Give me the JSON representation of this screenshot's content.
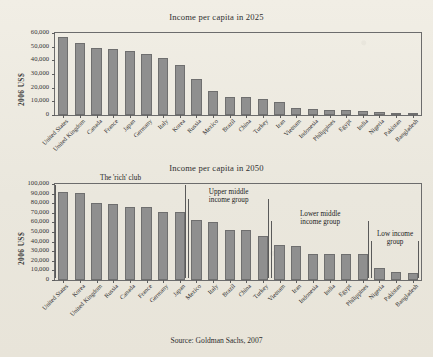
{
  "source_note": "Source: Goldman Sachs, 2007",
  "axis": {
    "ylabel": "2006 US$"
  },
  "chart_data": [
    {
      "type": "bar",
      "title": "Income per capita in 2025",
      "xlabel": "",
      "ylabel": "2006 US$",
      "ylim": [
        0,
        60000
      ],
      "yticks": [
        0,
        10000,
        20000,
        30000,
        40000,
        50000,
        60000
      ],
      "ytick_labels": [
        "0",
        "10,000",
        "20,000",
        "30,000",
        "40,000",
        "50,000",
        "60,000"
      ],
      "grid": false,
      "legend": "none",
      "categories": [
        "United States",
        "United Kingdom",
        "Canada",
        "France",
        "Japan",
        "Germany",
        "Italy",
        "Korea",
        "Russia",
        "Mexico",
        "Brazil",
        "China",
        "Turkey",
        "Iran",
        "Vietnam",
        "Indonesia",
        "Philippines",
        "Egypt",
        "India",
        "Nigeria",
        "Pakistan",
        "Bangladesh"
      ],
      "values": [
        57000,
        52500,
        49000,
        48500,
        46500,
        45000,
        41500,
        36800,
        26200,
        17700,
        13400,
        13000,
        12000,
        9700,
        5200,
        4300,
        3800,
        3700,
        2800,
        2100,
        1400,
        1200
      ]
    },
    {
      "type": "bar",
      "title": "Income per capita in 2050",
      "xlabel": "",
      "ylabel": "2006 US$",
      "ylim": [
        0,
        100000
      ],
      "yticks": [
        0,
        10000,
        20000,
        30000,
        40000,
        50000,
        60000,
        70000,
        80000,
        90000,
        100000
      ],
      "ytick_labels": [
        "0",
        "10,000",
        "20,000",
        "30,000",
        "40,000",
        "50,000",
        "60,000",
        "70,000",
        "80,000",
        "90,000",
        "100,000"
      ],
      "grid": false,
      "legend": "none",
      "categories": [
        "United States",
        "Korea",
        "United Kingdom",
        "Russia",
        "Canada",
        "France",
        "Germany",
        "Japan",
        "Mexico",
        "Italy",
        "Brazil",
        "China",
        "Turkey",
        "Vietnam",
        "Iran",
        "Indonesia",
        "India",
        "Egypt",
        "Philippines",
        "Nigeria",
        "Pakistan",
        "Bangladesh"
      ],
      "values": [
        91500,
        91000,
        80000,
        79500,
        76000,
        76000,
        71000,
        70500,
        63000,
        60500,
        52500,
        52000,
        45500,
        36500,
        35500,
        27000,
        27000,
        27000,
        27500,
        12500,
        8000,
        7500
      ],
      "annotations": [
        {
          "label": "The 'rich' club",
          "start_index": 0,
          "end_index": 7
        },
        {
          "label": "Upper middle\nincome group",
          "start_index": 8,
          "end_index": 12
        },
        {
          "label": "Lower middle\nincome group",
          "start_index": 13,
          "end_index": 18
        },
        {
          "label": "Low income\ngroup",
          "start_index": 19,
          "end_index": 21
        }
      ]
    }
  ],
  "colors": {
    "bar_fill": "#8f8f8f",
    "bar_stroke": "#6f6f6f",
    "axis": "#6c6c6c",
    "paper": "#efece3",
    "text": "#2b2b2b"
  }
}
